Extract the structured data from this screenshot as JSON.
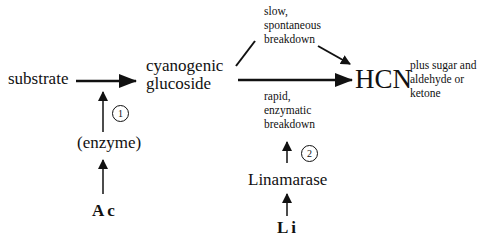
{
  "diagram": {
    "nodes": {
      "substrate": "substrate",
      "cyanogenic_glucoside_line1": "cyanogenic",
      "cyanogenic_glucoside_line2": "glucoside",
      "hcn": "HCN",
      "byproducts": "plus sugar and\naldehyde or\nketone",
      "enzyme": "(enzyme)",
      "linamarase": "Linamarase",
      "ac": "Ac",
      "li": "Li"
    },
    "edge_labels": {
      "slow": "slow,\nspontaneous\nbreakdown",
      "rapid": "rapid,\nenzymatic\nbreakdown"
    },
    "steps": {
      "step1": "1",
      "step2": "2"
    }
  }
}
